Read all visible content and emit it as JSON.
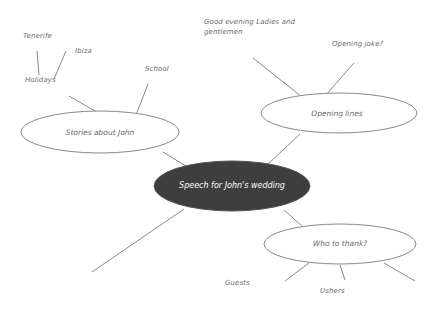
{
  "diagram": {
    "type": "mind-map",
    "colors": {
      "line": "#8a8a8a",
      "center_fill": "#3e3e3e",
      "center_text": "#ffffff",
      "branch_fill": "#ffffff",
      "branch_stroke": "#8a8a8a",
      "text": "#6a6a6a"
    },
    "center": {
      "label": "Speech for John's wedding"
    },
    "branches": [
      {
        "label": "Stories about John",
        "children": [
          {
            "label": "School"
          },
          {
            "label": "Holidays",
            "children": [
              {
                "label": "Tenerife"
              },
              {
                "label": "Ibiza"
              }
            ]
          }
        ]
      },
      {
        "label": "Opening lines",
        "children": [
          {
            "label": "Good evening Ladies and gentlemen"
          },
          {
            "label": "Opening joke?"
          }
        ]
      },
      {
        "label": "Who to thank?",
        "children": [
          {
            "label": "Guests"
          },
          {
            "label": "Ushers"
          },
          {
            "label": ""
          }
        ]
      },
      {
        "label": ""
      }
    ]
  }
}
